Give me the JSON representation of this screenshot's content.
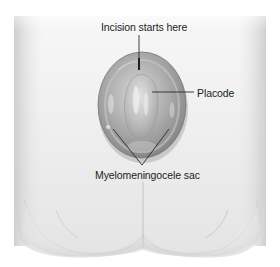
{
  "figure": {
    "style": "grayscale medical illustration",
    "labels": {
      "incision": "Incision starts here",
      "placode": "Placode",
      "sac": "Myelomeningocele sac"
    },
    "colors": {
      "background": "#ffffff",
      "skin_light": "#efefef",
      "skin_shadow": "#d2d2d2",
      "sac_fill": "#a8a8a8",
      "sac_edge": "#7a7a7a",
      "leader_line": "#2a2a2a",
      "label_text": "#1c1c1c"
    }
  }
}
